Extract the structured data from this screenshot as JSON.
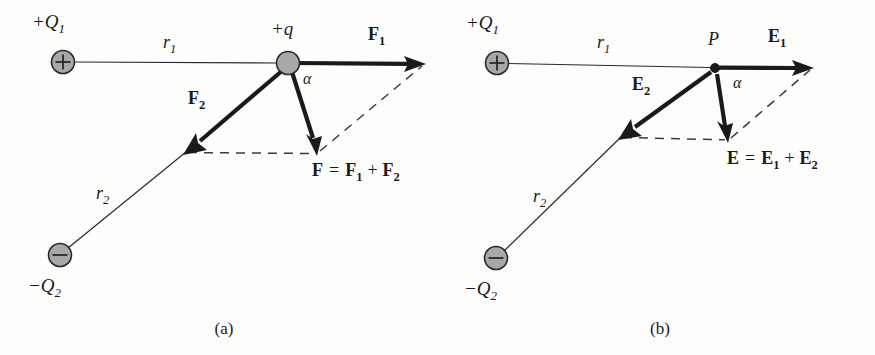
{
  "figure": {
    "background_color": "#fdfdfb",
    "ink_color": "#1a1a1a",
    "charge_fill_color": "#a8a8a8"
  },
  "panels": [
    {
      "id": "a",
      "caption": "(a)",
      "quantity": "force",
      "labels": {
        "charge1": "+Q",
        "charge1_sub": "1",
        "charge2": "−Q",
        "charge2_sub": "2",
        "test_object": "+q",
        "r1": "r",
        "r1_sub": "1",
        "r2": "r",
        "r2_sub": "2",
        "vec1": "F",
        "vec1_sub": "1",
        "vec2": "F",
        "vec2_sub": "2",
        "angle": "α",
        "resultant_lhs": "F",
        "resultant_eq": "=",
        "resultant_t1": "F",
        "resultant_t1_sub": "1",
        "resultant_plus": "+",
        "resultant_t2": "F",
        "resultant_t2_sub": "2"
      }
    },
    {
      "id": "b",
      "caption": "(b)",
      "quantity": "electric-field",
      "labels": {
        "charge1": "+Q",
        "charge1_sub": "1",
        "charge2": "−Q",
        "charge2_sub": "2",
        "test_object": "P",
        "r1": "r",
        "r1_sub": "1",
        "r2": "r",
        "r2_sub": "2",
        "vec1": "E",
        "vec1_sub": "1",
        "vec2": "E",
        "vec2_sub": "2",
        "angle": "α",
        "resultant_lhs": "E",
        "resultant_eq": "=",
        "resultant_t1": "E",
        "resultant_t1_sub": "1",
        "resultant_plus": "+",
        "resultant_t2": "E",
        "resultant_t2_sub": "2"
      }
    }
  ]
}
